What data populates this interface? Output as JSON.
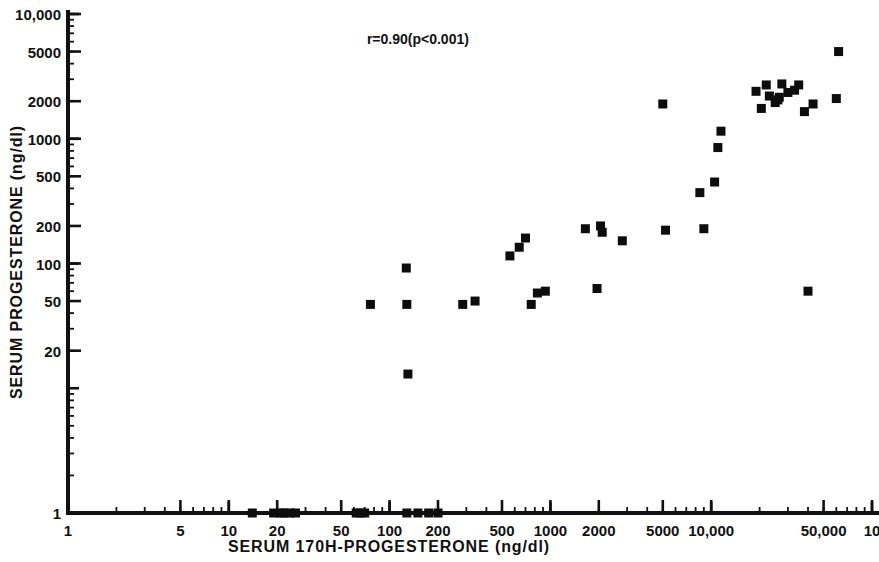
{
  "chart_data": {
    "type": "scatter",
    "title": "",
    "xlabel": "SERUM 170H-PROGESTERONE (ng/dl)",
    "ylabel": "SERUM PROGESTERONE (ng/dl)",
    "xscale": "log",
    "yscale": "log",
    "xlim": [
      1,
      100000
    ],
    "ylim": [
      1,
      10000
    ],
    "grid": false,
    "legend": null,
    "annotations": [
      {
        "text": "r=0.90(p<0.001)",
        "x": 150,
        "y": 5800
      }
    ],
    "x_tick_labels": [
      "1",
      "5",
      "10",
      "20",
      "50",
      "100",
      "200",
      "500",
      "1000",
      "2000",
      "5000",
      "10,000",
      "50,000",
      "10"
    ],
    "x_tick_values": [
      1,
      5,
      10,
      20,
      50,
      100,
      200,
      500,
      1000,
      2000,
      5000,
      10000,
      50000,
      100000
    ],
    "y_tick_labels": [
      "1",
      "20",
      "50",
      "100",
      "200",
      "500",
      "1000",
      "2000",
      "5000",
      "10,000"
    ],
    "y_tick_values": [
      1,
      20,
      50,
      100,
      200,
      500,
      1000,
      2000,
      5000,
      10000
    ],
    "marker": "square",
    "marker_color": "#0d0d0d",
    "points": [
      [
        14,
        1
      ],
      [
        19,
        1
      ],
      [
        21,
        1
      ],
      [
        22,
        1
      ],
      [
        24,
        1
      ],
      [
        26,
        1
      ],
      [
        62,
        1
      ],
      [
        66,
        1
      ],
      [
        70,
        1
      ],
      [
        128,
        1
      ],
      [
        150,
        1
      ],
      [
        175,
        1
      ],
      [
        200,
        1
      ],
      [
        130,
        13
      ],
      [
        76,
        47
      ],
      [
        128,
        47
      ],
      [
        127,
        92
      ],
      [
        285,
        47
      ],
      [
        340,
        50
      ],
      [
        760,
        47
      ],
      [
        830,
        58
      ],
      [
        930,
        60
      ],
      [
        1950,
        63
      ],
      [
        560,
        115
      ],
      [
        640,
        135
      ],
      [
        700,
        160
      ],
      [
        1650,
        190
      ],
      [
        2050,
        200
      ],
      [
        2100,
        178
      ],
      [
        2800,
        152
      ],
      [
        5200,
        185
      ],
      [
        9000,
        190
      ],
      [
        5000,
        1900
      ],
      [
        8500,
        370
      ],
      [
        10500,
        450
      ],
      [
        11000,
        850
      ],
      [
        11500,
        1150
      ],
      [
        19000,
        2400
      ],
      [
        20500,
        1750
      ],
      [
        22000,
        2700
      ],
      [
        23000,
        2200
      ],
      [
        25000,
        1950
      ],
      [
        26000,
        2050
      ],
      [
        26500,
        2150
      ],
      [
        27500,
        2750
      ],
      [
        30000,
        2350
      ],
      [
        33000,
        2450
      ],
      [
        35000,
        2700
      ],
      [
        38000,
        1650
      ],
      [
        40000,
        60
      ],
      [
        43000,
        1900
      ],
      [
        60000,
        2100
      ],
      [
        62000,
        5000
      ]
    ]
  }
}
